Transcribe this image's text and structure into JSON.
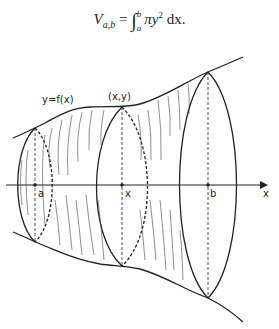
{
  "formula": {
    "lhs": "V",
    "lhs_sub": "a,b",
    "equals": "=",
    "integral": "∫",
    "lower": "a",
    "upper": "b",
    "integrand": "πy",
    "power": "2",
    "differential": " dx."
  },
  "labels": {
    "curve": "y=f(x)",
    "point": "(x,y)",
    "a": "a",
    "x_point": "x",
    "b": "b",
    "axis": "x"
  },
  "colors": {
    "ink": "#222222"
  }
}
